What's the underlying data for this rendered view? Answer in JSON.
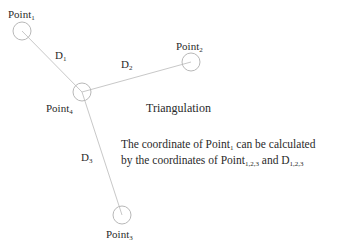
{
  "diagram": {
    "title": "Triangulation",
    "colors": {
      "line": "#c8c8c8",
      "circle": "#b8b8b8",
      "text": "#2a2a2a"
    },
    "nodes": [
      {
        "id": "point1",
        "label": "Point",
        "sub": "1",
        "cx": 22,
        "cy": 31,
        "r": 9
      },
      {
        "id": "point2",
        "label": "Point",
        "sub": "2",
        "cx": 191,
        "cy": 62,
        "r": 9
      },
      {
        "id": "point3",
        "label": "Point",
        "sub": "3",
        "cx": 122,
        "cy": 215,
        "r": 9
      },
      {
        "id": "point4",
        "label": "Point",
        "sub": "4",
        "cx": 82,
        "cy": 92,
        "r": 9
      }
    ],
    "edges": [
      {
        "from": "point4",
        "to": "point1",
        "label": "D",
        "sub": "1"
      },
      {
        "from": "point4",
        "to": "point2",
        "label": "D",
        "sub": "2"
      },
      {
        "from": "point4",
        "to": "point3",
        "label": "D",
        "sub": "3"
      }
    ],
    "description": {
      "line1_a": "The coordinate of Point",
      "line1_sub": "1",
      "line1_b": " can be calculated",
      "line2_a": "by the coordinates of Point",
      "line2_sub": "1,2,3",
      "line2_b": " and D",
      "line2_sub2": "1,2,3"
    }
  }
}
